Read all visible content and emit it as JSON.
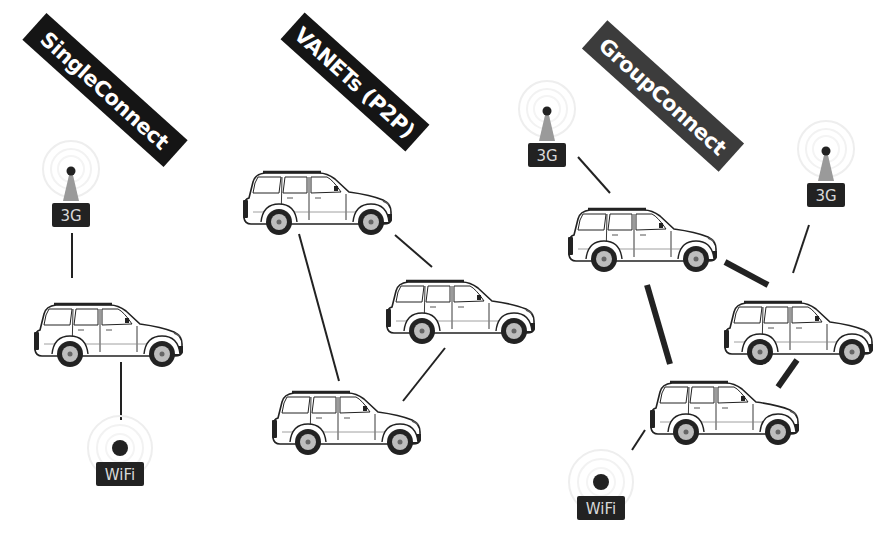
{
  "colors": {
    "banner_dark": "#151515",
    "banner_group": "#3c3c3c",
    "badge": "#222222",
    "antenna": "#9a9a9a",
    "link": "#222222"
  },
  "panels": [
    {
      "id": "single",
      "label": "SingleConnect",
      "vehicles": 1,
      "access_points": [
        "3G",
        "WiFi"
      ]
    },
    {
      "id": "vanet",
      "label": "VANETs (P2P)",
      "vehicles": 3,
      "access_points": []
    },
    {
      "id": "group",
      "label": "GroupConnect",
      "vehicles": 3,
      "access_points": [
        "3G",
        "3G",
        "WiFi"
      ]
    }
  ],
  "badges": {
    "cell": "3G",
    "wifi": "WiFi"
  }
}
